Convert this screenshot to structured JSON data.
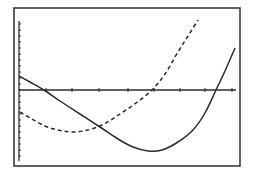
{
  "chart_data": {
    "type": "line",
    "title": "",
    "xlabel": "",
    "ylabel": "",
    "grid": false,
    "legend": null,
    "style": "graphing calculator screen",
    "colors": {
      "background": "#ffffff",
      "ink": "#2b2b2b",
      "frame": "#3a3a3a"
    },
    "frame_px": {
      "x0": 14,
      "y0": 8,
      "x1": 240,
      "y1": 166
    },
    "axes_px": {
      "y_axis_x": 19,
      "y_axis_top": 21,
      "y_axis_bottom": 161,
      "x_axis_y": 90,
      "x_axis_left": 19,
      "x_axis_right": 236,
      "x_ticks": [
        46,
        72,
        99,
        128,
        154,
        180,
        205,
        232
      ],
      "y_tick_spacing": 6
    },
    "series": [
      {
        "name": "solid curve",
        "style": "solid",
        "points_px": [
          [
            19,
            76
          ],
          [
            30,
            82
          ],
          [
            44,
            90
          ],
          [
            60,
            101
          ],
          [
            80,
            114
          ],
          [
            100,
            127
          ],
          [
            118,
            139
          ],
          [
            133,
            147
          ],
          [
            148,
            151
          ],
          [
            162,
            150
          ],
          [
            178,
            142
          ],
          [
            193,
            130
          ],
          [
            205,
            113
          ],
          [
            216,
            90
          ],
          [
            225,
            71
          ],
          [
            235,
            48
          ]
        ]
      },
      {
        "name": "dashed curve",
        "style": "dashed",
        "points_px": [
          [
            20,
            112
          ],
          [
            32,
            119
          ],
          [
            45,
            126
          ],
          [
            58,
            130
          ],
          [
            72,
            132
          ],
          [
            88,
            130
          ],
          [
            104,
            124
          ],
          [
            120,
            114
          ],
          [
            136,
            103
          ],
          [
            152,
            90
          ],
          [
            165,
            74
          ],
          [
            178,
            52
          ],
          [
            188,
            36
          ],
          [
            198,
            20
          ]
        ]
      }
    ]
  }
}
